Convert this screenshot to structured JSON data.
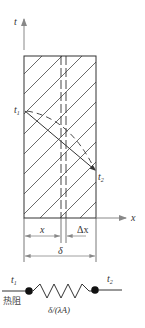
{
  "diagram": {
    "type": "one-dimensional steady heat conduction through plane wall",
    "axes": {
      "vertical_label": "t",
      "horizontal_label": "x"
    },
    "temperatures": {
      "left_label": "t",
      "left_sub": "1",
      "right_label": "t",
      "right_sub": "2"
    },
    "dimensions": {
      "x_label": "x",
      "dx_label": "Δx",
      "thickness_label": "δ"
    },
    "thermal_circuit": {
      "left_label": "t",
      "left_sub": "1",
      "right_label": "t",
      "right_sub": "2",
      "resistance_caption": "热阻",
      "resistance_value": "δ/(λA)"
    },
    "colors": {
      "line": "#333333",
      "axis": "#888888",
      "hatch": "#444444"
    }
  }
}
